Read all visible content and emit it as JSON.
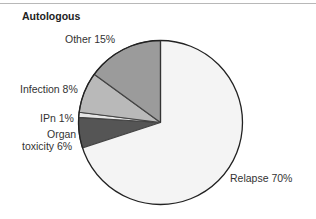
{
  "chart_data": {
    "type": "pie",
    "title": "Autologous",
    "start_angle_deg": 0,
    "direction": "clockwise",
    "slices": [
      {
        "label": "Relapse",
        "value": 70,
        "display": "Relapse 70%",
        "color": "#f4f4f4"
      },
      {
        "label": "Organ toxicity",
        "value": 6,
        "display": "Organ toxicity 6%",
        "color": "#555555"
      },
      {
        "label": "IPn",
        "value": 1,
        "display": "IPn 1%",
        "color": "#e6e6e6"
      },
      {
        "label": "Infection",
        "value": 8,
        "display": "Infection 8%",
        "color": "#b9b9b9"
      },
      {
        "label": "Other",
        "value": 15,
        "display": "Other 15%",
        "color": "#9b9b9b"
      }
    ],
    "legend": "none (direct labels)"
  },
  "labels": {
    "relapse": "Relapse 70%",
    "organ_line1": "Organ",
    "organ_line2": "toxicity 6%",
    "ipn": "IPn 1%",
    "infection": "Infection 8%",
    "other": "Other 15%"
  }
}
